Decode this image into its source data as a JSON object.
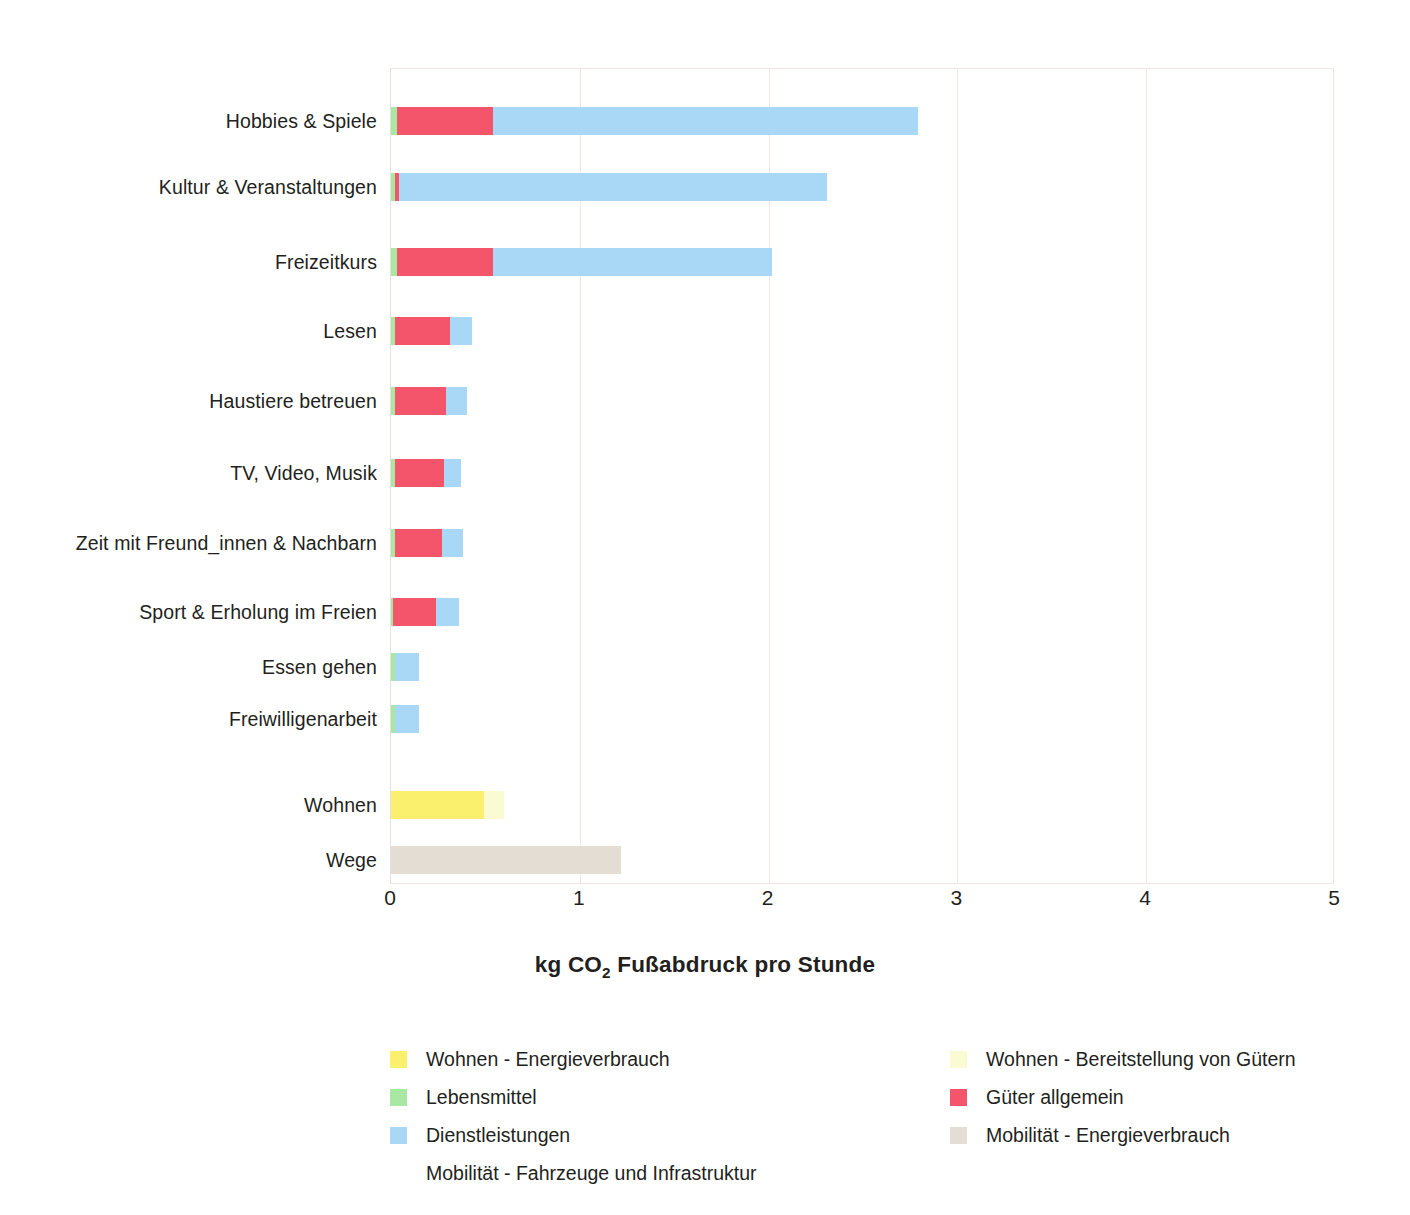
{
  "chart_data": {
    "type": "bar",
    "orientation": "horizontal",
    "stacked": true,
    "title": "",
    "xlabel": "kg CO2 Fußabdruck pro Stunde",
    "ylabel": "",
    "xlim": [
      0,
      5
    ],
    "xticks": [
      "0",
      "1",
      "2",
      "3",
      "4",
      "5"
    ],
    "grid": true,
    "legend_position": "bottom",
    "categories": [
      "Hobbies & Spiele",
      "Kultur & Veranstaltungen",
      "Freizeitkurs",
      "Lesen",
      "Haustiere betreuen",
      "TV, Video, Musik",
      "Zeit mit Freund_innen & Nachbarn",
      "Sport & Erholung im Freien",
      "Essen gehen",
      "Freiwilligenarbeit",
      "Wohnen",
      "Wege"
    ],
    "series": [
      {
        "name": "Wohnen - Energieverbrauch",
        "color": "#FAF06E",
        "values": [
          0,
          0,
          0,
          0,
          0,
          0,
          0,
          0,
          0,
          0,
          0.49,
          0
        ]
      },
      {
        "name": "Wohnen - Bereitstellung von Gütern",
        "color": "#FBFBD3",
        "values": [
          0,
          0,
          0,
          0,
          0,
          0,
          0,
          0,
          0,
          0,
          0.11,
          0
        ]
      },
      {
        "name": "Lebensmittel",
        "color": "#A9E8A2",
        "values": [
          0.03,
          0.02,
          0.03,
          0.02,
          0.02,
          0.02,
          0.02,
          0.01,
          0.02,
          0.02,
          0,
          0
        ]
      },
      {
        "name": "Güter allgemein",
        "color": "#F4556A",
        "values": [
          0.51,
          0.02,
          0.51,
          0.29,
          0.27,
          0.26,
          0.25,
          0.23,
          0,
          0,
          0,
          0
        ]
      },
      {
        "name": "Dienstleistungen",
        "color": "#A8D8F5",
        "values": [
          2.25,
          2.27,
          1.48,
          0.12,
          0.11,
          0.09,
          0.11,
          0.12,
          0.13,
          0.13,
          0,
          0
        ]
      },
      {
        "name": "Mobilität - Energieverbrauch",
        "color": "#E4DDD4",
        "values": [
          0,
          0,
          0,
          0,
          0,
          0,
          0,
          0,
          0,
          0,
          0,
          1.22
        ]
      },
      {
        "name": "Mobilität - Fahrzeuge und Infrastruktur",
        "color": "#FFFFFF",
        "values": [
          0,
          0,
          0,
          0,
          0,
          0,
          0,
          0,
          0,
          0,
          0,
          0
        ]
      }
    ],
    "totals": [
      2.79,
      2.31,
      2.02,
      0.43,
      0.4,
      0.37,
      0.38,
      0.36,
      0.15,
      0.15,
      0.6,
      1.22
    ]
  },
  "axis": {
    "x_title_prefix": "kg CO",
    "x_title_sub": "2",
    "x_title_suffix": " Fußabdruck pro Stunde"
  },
  "legend": {
    "left_column": [
      {
        "label": "Wohnen - Energieverbrauch",
        "color": "#FAF06E",
        "has_swatch": true
      },
      {
        "label": "Lebensmittel",
        "color": "#A9E8A2",
        "has_swatch": true
      },
      {
        "label": "Dienstleistungen",
        "color": "#A8D8F5",
        "has_swatch": true
      },
      {
        "label": "Mobilität - Fahrzeuge und Infrastruktur",
        "color": "#FFFFFF",
        "has_swatch": false
      }
    ],
    "right_column": [
      {
        "label": "Wohnen - Bereitstellung von Gütern",
        "color": "#FBFBD3",
        "has_swatch": true
      },
      {
        "label": "Güter allgemein",
        "color": "#F4556A",
        "has_swatch": true
      },
      {
        "label": "Mobilität - Energieverbrauch",
        "color": "#E4DDD4",
        "has_swatch": true
      }
    ]
  },
  "colors": {
    "grid": "#F0E7E3",
    "frame": "#EFE6E3",
    "text": "#231F20",
    "background": "#FFFFFF"
  }
}
